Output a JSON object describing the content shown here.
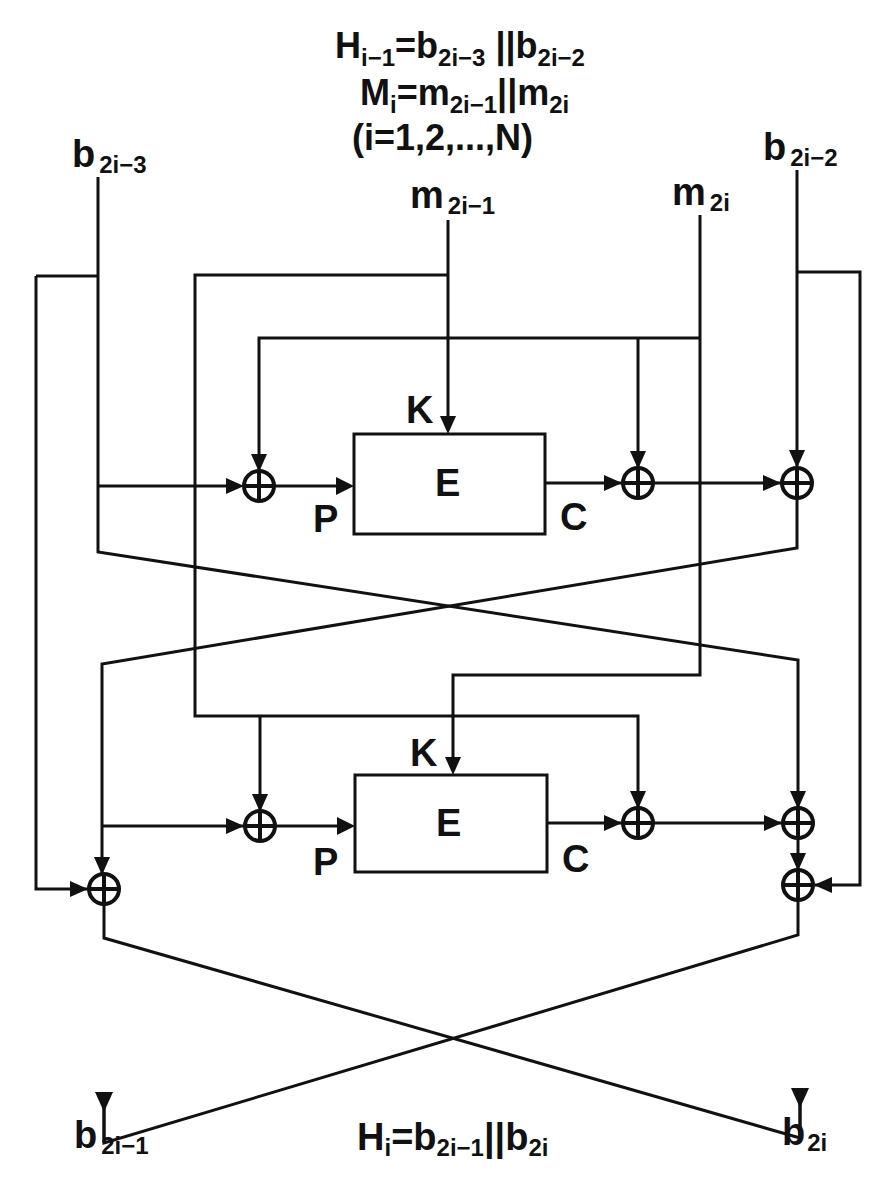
{
  "header": {
    "line1": {
      "main": "H",
      "sub1": "i−1",
      "eq": "=b",
      "sub2": "2i−3",
      "cat": " ||b",
      "sub3": "2i−2"
    },
    "line2": {
      "main": "M",
      "sub1": "i",
      "eq": "=m",
      "sub2": "2i−1",
      "cat": "||m",
      "sub3": "2i"
    },
    "line3": "(i=1,2,...,N)"
  },
  "inputs": {
    "b_left": {
      "main": "b",
      "sub": "2i−3"
    },
    "m_left": {
      "main": "m",
      "sub": "2i−1"
    },
    "m_right": {
      "main": "m",
      "sub": "2i"
    },
    "b_right": {
      "main": "b",
      "sub": "2i−2"
    }
  },
  "blocks": [
    {
      "label": "E",
      "key_label": "K",
      "plain_label": "P",
      "cipher_label": "C"
    },
    {
      "label": "E",
      "key_label": "K",
      "plain_label": "P",
      "cipher_label": "C"
    }
  ],
  "outputs": {
    "b_left": {
      "main": "b",
      "sub": "2i−1"
    },
    "b_right": {
      "main": "b",
      "sub": "2i"
    }
  },
  "footer": {
    "main": "H",
    "sub1": "i",
    "eq": "=b",
    "sub2": "2i−1",
    "cat": "||b",
    "sub3": "2i"
  },
  "colors": {
    "ink": "#111111",
    "background": "#ffffff"
  },
  "icons": {
    "xor": "circled-plus-icon",
    "arrow": "arrowhead-icon"
  }
}
